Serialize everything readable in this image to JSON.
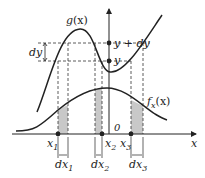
{
  "diagram": {
    "title": "",
    "colors": {
      "line": "#222222",
      "shade": "#c8c8c8",
      "dash": "#333333",
      "background": "#ffffff"
    },
    "curves": {
      "g": {
        "label": "g",
        "label_arg": "(x)"
      },
      "f": {
        "label": "f",
        "label_sub": "x",
        "label_arg": "(x)"
      }
    },
    "y_axis": {
      "upper_label": "y + dy",
      "lower_label": "y",
      "interval_label": "dy"
    },
    "x_axis": {
      "label": "x",
      "origin_label": "0",
      "points": [
        {
          "label": "x",
          "sub": "1",
          "interval": "dx",
          "interval_sub": "1"
        },
        {
          "label": "x",
          "sub": "2",
          "interval": "dx",
          "interval_sub": "2"
        },
        {
          "label": "x",
          "sub": "3",
          "interval": "dx",
          "interval_sub": "3"
        }
      ]
    }
  }
}
